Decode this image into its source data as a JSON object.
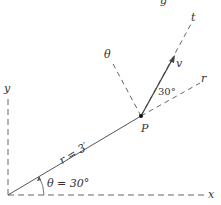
{
  "diagram": {
    "axes": {
      "x_label": "x",
      "y_label": "y"
    },
    "point": {
      "label": "P"
    },
    "directions": {
      "radial": "r",
      "transverse": "θ",
      "tangent": "t"
    },
    "velocity": {
      "label": "v",
      "angle_label": "30°"
    },
    "radius_label": "r = 3′",
    "theta_label": "θ = 30°",
    "top_clipped_glyph": "g",
    "colors": {
      "line": "#555555",
      "text": "#333333",
      "background": "#ffffff"
    }
  }
}
